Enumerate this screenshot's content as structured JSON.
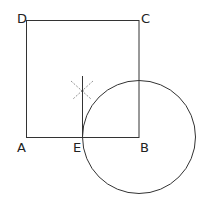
{
  "diagram": {
    "type": "geometric-construction",
    "square": {
      "vertices": [
        "A",
        "B",
        "C",
        "D"
      ]
    },
    "points": {
      "A": "A",
      "B": "B",
      "C": "C",
      "D": "D",
      "E": "E"
    },
    "circle": {
      "center": "B",
      "through": "E"
    },
    "perpendicular": {
      "at": "E",
      "construction_marks": "dashed arcs"
    },
    "colors": {
      "stroke": "#333333",
      "dashed": "#777777"
    }
  }
}
